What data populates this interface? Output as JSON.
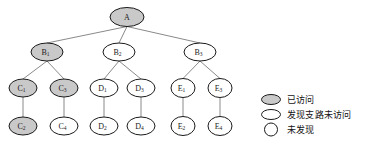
{
  "diagram": {
    "title": "",
    "colors": {
      "visited_fill": "#c9c9c9",
      "unvisited_fill": "#ffffff",
      "node_stroke": "#1a1a1a",
      "edge_stroke": "#8a8a8a"
    },
    "nodes": [
      {
        "id": "A",
        "base": "A",
        "sub": "",
        "x": 127,
        "y": 17,
        "rx": 17,
        "ry": 9.5,
        "state": "visited"
      },
      {
        "id": "B1",
        "base": "B",
        "sub": "1",
        "x": 47,
        "y": 52,
        "rx": 16,
        "ry": 9,
        "state": "visited"
      },
      {
        "id": "B2",
        "base": "B",
        "sub": "2",
        "x": 119,
        "y": 52,
        "rx": 16,
        "ry": 9,
        "state": "discovered"
      },
      {
        "id": "B3",
        "base": "B",
        "sub": "3",
        "x": 200,
        "y": 52,
        "rx": 16,
        "ry": 9,
        "state": "discovered"
      },
      {
        "id": "C1",
        "base": "C",
        "sub": "1",
        "x": 23,
        "y": 88,
        "rx": 14,
        "ry": 9,
        "state": "visited"
      },
      {
        "id": "C3",
        "base": "C",
        "sub": "3",
        "x": 64,
        "y": 88,
        "rx": 14,
        "ry": 9,
        "state": "visited"
      },
      {
        "id": "D1",
        "base": "D",
        "sub": "1",
        "x": 104,
        "y": 88,
        "rx": 14,
        "ry": 9,
        "state": "discovered"
      },
      {
        "id": "D3",
        "base": "D",
        "sub": "3",
        "x": 141,
        "y": 88,
        "rx": 14,
        "ry": 9,
        "state": "discovered"
      },
      {
        "id": "E1",
        "base": "E",
        "sub": "1",
        "x": 183,
        "y": 88,
        "rx": 12,
        "ry": 9.5,
        "state": "undiscovered"
      },
      {
        "id": "E3",
        "base": "E",
        "sub": "3",
        "x": 220,
        "y": 88,
        "rx": 12,
        "ry": 9.5,
        "state": "undiscovered"
      },
      {
        "id": "C2",
        "base": "C",
        "sub": "2",
        "x": 23,
        "y": 126,
        "rx": 14,
        "ry": 9,
        "state": "visited"
      },
      {
        "id": "C4",
        "base": "C",
        "sub": "4",
        "x": 64,
        "y": 126,
        "rx": 14,
        "ry": 9,
        "state": "discovered"
      },
      {
        "id": "D2",
        "base": "D",
        "sub": "2",
        "x": 104,
        "y": 126,
        "rx": 14,
        "ry": 9,
        "state": "discovered"
      },
      {
        "id": "D4",
        "base": "D",
        "sub": "4",
        "x": 141,
        "y": 126,
        "rx": 14,
        "ry": 9,
        "state": "discovered"
      },
      {
        "id": "E2",
        "base": "E",
        "sub": "2",
        "x": 183,
        "y": 126,
        "rx": 12,
        "ry": 9.5,
        "state": "undiscovered"
      },
      {
        "id": "E4",
        "base": "E",
        "sub": "4",
        "x": 220,
        "y": 126,
        "rx": 12,
        "ry": 9.5,
        "state": "undiscovered"
      }
    ],
    "edges": [
      {
        "from": "A",
        "to": "B1"
      },
      {
        "from": "A",
        "to": "B2"
      },
      {
        "from": "A",
        "to": "B3"
      },
      {
        "from": "B1",
        "to": "C1"
      },
      {
        "from": "B1",
        "to": "C3"
      },
      {
        "from": "B2",
        "to": "D1"
      },
      {
        "from": "B2",
        "to": "D3"
      },
      {
        "from": "B3",
        "to": "E1"
      },
      {
        "from": "B3",
        "to": "E3"
      },
      {
        "from": "C1",
        "to": "C2"
      },
      {
        "from": "C3",
        "to": "C4"
      },
      {
        "from": "D1",
        "to": "D2"
      },
      {
        "from": "D3",
        "to": "D4"
      },
      {
        "from": "E1",
        "to": "E2"
      },
      {
        "from": "E3",
        "to": "E4"
      }
    ]
  },
  "legend": {
    "items": [
      {
        "label": "已访问",
        "shape": "ellipse",
        "fill": "#c9c9c9",
        "state": "visited"
      },
      {
        "label": "发现支路未访问",
        "shape": "ellipse",
        "fill": "#ffffff",
        "state": "discovered"
      },
      {
        "label": "未发现",
        "shape": "circle",
        "fill": "#ffffff",
        "state": "undiscovered"
      }
    ]
  }
}
